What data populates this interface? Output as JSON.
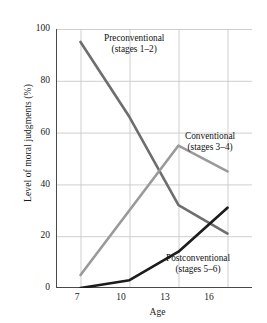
{
  "chart_data": {
    "type": "line",
    "title": "",
    "xlabel": "Age",
    "ylabel": "Level of moral judgments (%)",
    "x": [
      7,
      10,
      13,
      16
    ],
    "xticklabels": [
      "7",
      "10",
      "13",
      "16"
    ],
    "yticklabels": [
      "0",
      "20",
      "40",
      "60",
      "80",
      "100"
    ],
    "yticks": [
      0,
      20,
      40,
      60,
      80,
      100
    ],
    "xlim": [
      5.5,
      17.5
    ],
    "ylim": [
      0,
      100
    ],
    "grid": true,
    "legend": "inline-annotations",
    "series": [
      {
        "name": "Preconventional",
        "sublabel": "(stages 1–2)",
        "color": "#6e6e6e",
        "values": [
          95,
          66,
          32,
          21
        ]
      },
      {
        "name": "Conventional",
        "sublabel": "(stages 3–4)",
        "color": "#9a9a9a",
        "values": [
          5,
          30,
          55,
          45
        ]
      },
      {
        "name": "Postconventional",
        "sublabel": "(stages 5–6)",
        "color": "#1c1c1c",
        "values": [
          0,
          3,
          14,
          31
        ]
      }
    ]
  },
  "annotations": {
    "preconventional_line1": "Preconventional",
    "preconventional_line2": "(stages 1–2)",
    "conventional_line1": "Conventional",
    "conventional_line2": "(stages 3–4)",
    "postconventional_line1": "Postconventional",
    "postconventional_line2": "(stages 5–6)"
  },
  "axes": {
    "x_title": "Age",
    "y_title": "Level of moral judgments (%)",
    "y_tick_0": "0",
    "y_tick_1": "20",
    "y_tick_2": "40",
    "y_tick_3": "60",
    "y_tick_4": "80",
    "y_tick_5": "100",
    "x_tick_0": "7",
    "x_tick_1": "10",
    "x_tick_2": "13",
    "x_tick_3": "16"
  },
  "colors": {
    "grid": "#c9c9c9",
    "axis": "#4a4a4a",
    "text": "#1a1a1a",
    "background": "#ffffff"
  }
}
